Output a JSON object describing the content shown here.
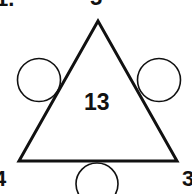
{
  "puzzle": {
    "question_number": "1.",
    "target_sum": "13",
    "corners": {
      "top": "5",
      "bottom_left": "4",
      "bottom_right": "3"
    },
    "side_circles": [
      {
        "position": "left-side",
        "value": ""
      },
      {
        "position": "right-side",
        "value": ""
      },
      {
        "position": "bottom-side",
        "value": ""
      }
    ]
  },
  "colors": {
    "stroke": "#111111",
    "background": "#ffffff"
  }
}
